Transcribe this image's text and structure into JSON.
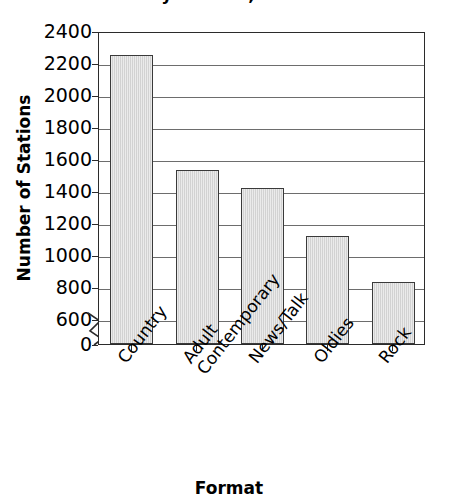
{
  "chart_data": {
    "type": "bar",
    "title": "by Format, 2000",
    "xlabel": "Format",
    "ylabel": "Number of Stations",
    "categories": [
      "Country",
      "Adult Contemporary",
      "News/Talk",
      "Oldies",
      "Rock"
    ],
    "category_lines": [
      [
        "Country"
      ],
      [
        "Adult",
        "Contemporary"
      ],
      [
        "News/Talk"
      ],
      [
        "Oldies"
      ],
      [
        "Rock"
      ]
    ],
    "values": [
      2250,
      1530,
      1420,
      1120,
      830
    ],
    "yticks": [
      "0",
      "600",
      "800",
      "1000",
      "1200",
      "1400",
      "1600",
      "1800",
      "2000",
      "2200",
      "2400"
    ],
    "ytick_values": [
      0,
      600,
      800,
      1000,
      1200,
      1400,
      1600,
      1800,
      2000,
      2200,
      2400
    ],
    "ylim": [
      600,
      2400
    ],
    "axis_break": true,
    "axis_break_between": [
      0,
      600
    ],
    "grid": true,
    "legend": "none",
    "bar_fill_color": "#d2d2d2",
    "bar_border_color": "#3a3a3a",
    "grid_color": "#6d6d6d",
    "frame_color": "#2b2b2b"
  }
}
